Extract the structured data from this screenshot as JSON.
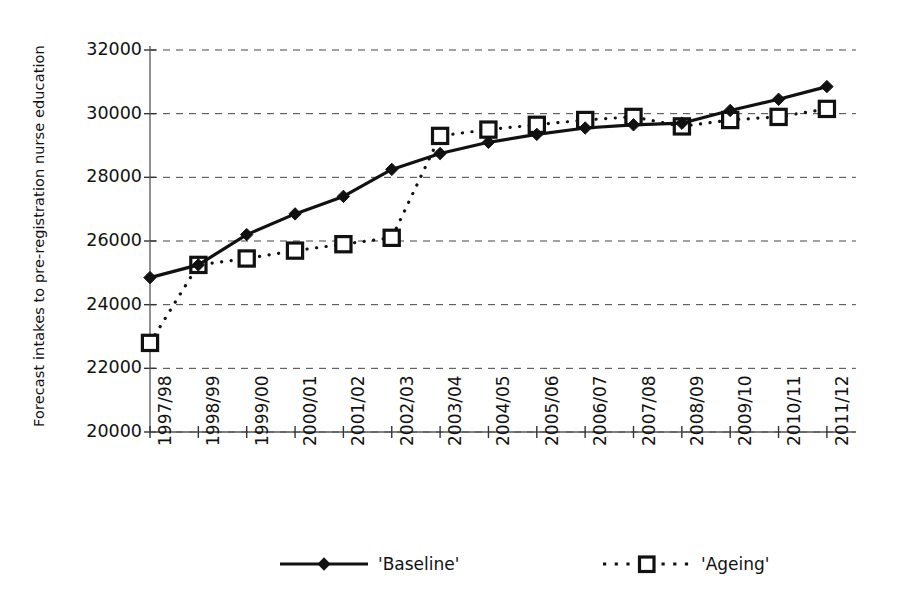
{
  "chart_data": {
    "type": "line",
    "title": "",
    "xlabel": "",
    "ylabel": "Forecast intakes to pre-registration nurse education",
    "categories": [
      "1997/98",
      "1998/99",
      "1999/00",
      "2000/01",
      "2001/02",
      "2002/03",
      "2003/04",
      "2004/05",
      "2005/06",
      "2006/07",
      "2007/08",
      "2008/09",
      "2009/10",
      "2010/11",
      "2011/12"
    ],
    "ylim": [
      20000,
      32000
    ],
    "ytick_labels": [
      "32000",
      "30000",
      "28000",
      "26000",
      "24000",
      "22000",
      "20000"
    ],
    "ytick_values": [
      32000,
      30000,
      28000,
      26000,
      24000,
      22000,
      20000
    ],
    "grid": true,
    "legend_position": "bottom",
    "series": [
      {
        "name": "'Baseline'",
        "marker": "filled-diamond",
        "line_style": "solid",
        "color": "#111111",
        "values": [
          24850,
          25250,
          26200,
          26850,
          27400,
          28250,
          28750,
          29100,
          29350,
          29550,
          29650,
          29700,
          30100,
          30450,
          30850
        ]
      },
      {
        "name": "'Ageing'",
        "marker": "open-square",
        "line_style": "dotted",
        "color": "#111111",
        "values": [
          22800,
          25250,
          25450,
          25700,
          25900,
          26100,
          29300,
          29500,
          29650,
          29800,
          29900,
          29600,
          29800,
          29900,
          30150
        ]
      }
    ]
  },
  "legend": {
    "items": [
      {
        "label": "'Baseline'",
        "style": "solid-diamond"
      },
      {
        "label": "'Ageing'",
        "style": "dotted-square"
      }
    ]
  },
  "axis": {
    "y_title": "Forecast intakes to pre-registration nurse education"
  }
}
